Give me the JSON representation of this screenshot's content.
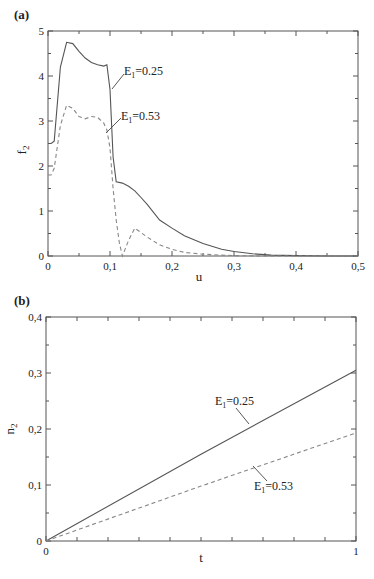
{
  "chart_data": [
    {
      "panel": "(a)",
      "type": "line",
      "title": "",
      "xlabel": "u",
      "ylabel": "f_2",
      "xlim": [
        0,
        0.5
      ],
      "ylim": [
        0,
        5
      ],
      "xticks": [
        "0",
        "0,1",
        "0,2",
        "0,3",
        "0,4",
        "0,5"
      ],
      "yticks": [
        "0",
        "1",
        "2",
        "3",
        "4",
        "5"
      ],
      "grid": false,
      "legend": "inline annotations",
      "series": [
        {
          "name": "E1=0.25",
          "style": "solid",
          "x": [
            0,
            0.005,
            0.01,
            0.02,
            0.03,
            0.04,
            0.05,
            0.06,
            0.07,
            0.08,
            0.09,
            0.095,
            0.1,
            0.105,
            0.11,
            0.12,
            0.13,
            0.14,
            0.15,
            0.16,
            0.18,
            0.2,
            0.22,
            0.25,
            0.28,
            0.3,
            0.33,
            0.36,
            0.4,
            0.45,
            0.5
          ],
          "y": [
            2.5,
            2.5,
            2.55,
            4.2,
            4.75,
            4.72,
            4.55,
            4.4,
            4.3,
            4.25,
            4.22,
            4.25,
            3.7,
            2.2,
            1.65,
            1.62,
            1.55,
            1.45,
            1.3,
            1.15,
            0.8,
            0.62,
            0.45,
            0.28,
            0.15,
            0.1,
            0.05,
            0.02,
            0.01,
            0.0,
            0.0
          ]
        },
        {
          "name": "E1=0.53",
          "style": "dashed",
          "x": [
            0,
            0.005,
            0.01,
            0.02,
            0.03,
            0.04,
            0.05,
            0.06,
            0.07,
            0.08,
            0.09,
            0.095,
            0.1,
            0.105,
            0.11,
            0.115,
            0.12,
            0.13,
            0.14,
            0.15,
            0.16,
            0.18,
            0.2,
            0.22,
            0.25,
            0.28,
            0.3,
            0.35,
            0.4,
            0.5
          ],
          "y": [
            1.8,
            1.8,
            1.95,
            2.9,
            3.35,
            3.28,
            3.1,
            3.05,
            3.1,
            3.08,
            2.95,
            2.8,
            2.4,
            1.5,
            0.8,
            0.3,
            0.0,
            0.35,
            0.62,
            0.52,
            0.42,
            0.25,
            0.15,
            0.08,
            0.04,
            0.02,
            0.01,
            0.0,
            0.0,
            0.0
          ]
        }
      ],
      "annotations": [
        {
          "text": "E1=0.25",
          "label": "E",
          "sub": "1",
          "value": "=0.25"
        },
        {
          "text": "E1=0.53",
          "label": "E",
          "sub": "1",
          "value": "=0.53"
        }
      ]
    },
    {
      "panel": "(b)",
      "type": "line",
      "title": "",
      "xlabel": "t",
      "ylabel": "n_2",
      "xlim": [
        0,
        1
      ],
      "ylim": [
        0,
        0.4
      ],
      "xticks": [
        "0",
        "1"
      ],
      "yticks": [
        "0",
        "0,1",
        "0,2",
        "0,3",
        "0,4"
      ],
      "grid": false,
      "legend": "inline annotations",
      "series": [
        {
          "name": "E1=0.25",
          "style": "solid",
          "x": [
            0,
            0.5,
            1
          ],
          "y": [
            0,
            0.155,
            0.305
          ]
        },
        {
          "name": "E1=0.53",
          "style": "dashed",
          "x": [
            0,
            0.5,
            1
          ],
          "y": [
            0,
            0.098,
            0.193
          ]
        }
      ],
      "annotations": [
        {
          "text": "E1=0.25",
          "label": "E",
          "sub": "1",
          "value": "=0.25"
        },
        {
          "text": "E1=0.53",
          "label": "E",
          "sub": "1",
          "value": "=0.53"
        }
      ]
    }
  ],
  "panels": {
    "a": {
      "label": "(a)",
      "xlabel": "u",
      "ylabel_main": "f",
      "ylabel_sub": "2",
      "xticks": [
        "0",
        "0,1",
        "0,2",
        "0,3",
        "0,4",
        "0,5"
      ],
      "yticks": [
        "0",
        "1",
        "2",
        "3",
        "4",
        "5"
      ],
      "ann1": {
        "main": "E",
        "sub": "1",
        "value": "=0.25"
      },
      "ann2": {
        "main": "E",
        "sub": "1",
        "value": "=0.53"
      }
    },
    "b": {
      "label": "(b)",
      "xlabel": "t",
      "ylabel_main": "n",
      "ylabel_sub": "2",
      "xticks": [
        "0",
        "1"
      ],
      "yticks": [
        "0",
        "0,1",
        "0,2",
        "0,3",
        "0,4"
      ],
      "ann1": {
        "main": "E",
        "sub": "1",
        "value": "=0.25"
      },
      "ann2": {
        "main": "E",
        "sub": "1",
        "value": "=0.53"
      }
    }
  }
}
